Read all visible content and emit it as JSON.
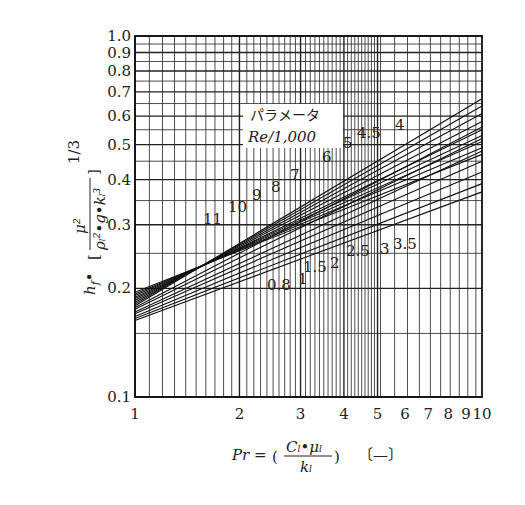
{
  "chart_data": {
    "type": "line",
    "xscale": "log",
    "yscale": "log",
    "xlim": [
      1,
      10
    ],
    "ylim": [
      0.1,
      1.0
    ],
    "xlabel": "Pr = (C_l·μ_l / k_l) [−]",
    "ylabel": "h_f·[μ² / (ρ_l²·g·k_l³)]^(1/3)",
    "grid": true,
    "x_ticks": [
      "1",
      "2",
      "3",
      "4",
      "5",
      "6",
      "7",
      "8",
      "9",
      "10"
    ],
    "y_ticks": [
      "0.1",
      "0.2",
      "0.3",
      "0.4",
      "0.5",
      "0.6",
      "0.7",
      "0.8",
      "0.9",
      "1.0"
    ],
    "legend_title": "パラメータ",
    "legend_subtitle": "Re/1,000",
    "series": [
      {
        "name": "11",
        "x": [
          1,
          10
        ],
        "values": [
          0.195,
          0.47
        ]
      },
      {
        "name": "10",
        "x": [
          1,
          10
        ],
        "values": [
          0.193,
          0.49
        ]
      },
      {
        "name": "9",
        "x": [
          1,
          10
        ],
        "values": [
          0.191,
          0.51
        ]
      },
      {
        "name": "8",
        "x": [
          1,
          10
        ],
        "values": [
          0.189,
          0.53
        ]
      },
      {
        "name": "7",
        "x": [
          1,
          10
        ],
        "values": [
          0.187,
          0.55
        ]
      },
      {
        "name": "6",
        "x": [
          1,
          10
        ],
        "values": [
          0.185,
          0.58
        ]
      },
      {
        "name": "5",
        "x": [
          1,
          10
        ],
        "values": [
          0.183,
          0.61
        ]
      },
      {
        "name": "4.5",
        "x": [
          1,
          10
        ],
        "values": [
          0.181,
          0.64
        ]
      },
      {
        "name": "4",
        "x": [
          1,
          10
        ],
        "values": [
          0.179,
          0.67
        ]
      },
      {
        "name": "3.5",
        "x": [
          1,
          10
        ],
        "values": [
          0.177,
          0.56
        ]
      },
      {
        "name": "3",
        "x": [
          1,
          10
        ],
        "values": [
          0.175,
          0.52
        ]
      },
      {
        "name": "2.5",
        "x": [
          1,
          10
        ],
        "values": [
          0.172,
          0.48
        ]
      },
      {
        "name": "2",
        "x": [
          1,
          10
        ],
        "values": [
          0.17,
          0.45
        ]
      },
      {
        "name": "1.5",
        "x": [
          1,
          10
        ],
        "values": [
          0.167,
          0.42
        ]
      },
      {
        "name": "1",
        "x": [
          1,
          10
        ],
        "values": [
          0.165,
          0.39
        ]
      },
      {
        "name": "0.8",
        "x": [
          1,
          10
        ],
        "values": [
          0.163,
          0.37
        ]
      }
    ]
  },
  "labels": {
    "y_axis": "h_f•[μ²/(ρ_l²•g•k_l³)]^1/3",
    "y_axis_prefix": "h",
    "y_axis_sub": "f",
    "y_axis_exp": "1/3",
    "x_axis_main": "Pr =",
    "x_axis_num": "C_l•μ_l",
    "x_axis_den": "k_l",
    "x_axis_unit": "〔—〕",
    "legend_title": "パラメータ",
    "legend_subtitle": "Re/1,000"
  }
}
